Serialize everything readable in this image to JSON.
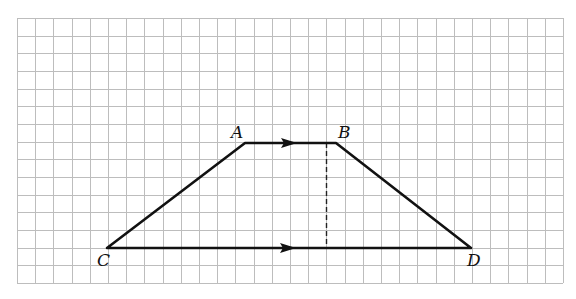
{
  "figure": {
    "grid": {
      "left": 17,
      "top": 18,
      "right": 563,
      "bottom": 283,
      "columns": 30,
      "rows": 15,
      "line_color": "#bdbdbd"
    },
    "vertices": {
      "A": {
        "label": "A",
        "x": 245,
        "y": 143,
        "label_x": 231,
        "label_y": 138
      },
      "B": {
        "label": "B",
        "x": 336,
        "y": 143,
        "label_x": 338,
        "label_y": 138
      },
      "C": {
        "label": "C",
        "x": 107,
        "y": 248,
        "label_x": 97,
        "label_y": 266
      },
      "D": {
        "label": "D",
        "x": 471,
        "y": 248,
        "label_x": 467,
        "label_y": 266
      }
    },
    "edges": [
      {
        "from": "A",
        "to": "B",
        "parallel_mark": true
      },
      {
        "from": "B",
        "to": "D",
        "parallel_mark": false
      },
      {
        "from": "D",
        "to": "C",
        "parallel_mark": true
      },
      {
        "from": "C",
        "to": "A",
        "parallel_mark": false
      }
    ],
    "parallel_arrows": [
      {
        "edge": "AB",
        "x_start": 281,
        "x_end": 297,
        "y": 143
      },
      {
        "edge": "CD",
        "x_start": 280,
        "x_end": 296,
        "y": 248
      }
    ],
    "height_segment": {
      "x": 326.5,
      "y_top": 143,
      "y_bottom": 248,
      "style": "dashed"
    },
    "colors": {
      "line": "#111111",
      "background": "#ffffff"
    }
  }
}
